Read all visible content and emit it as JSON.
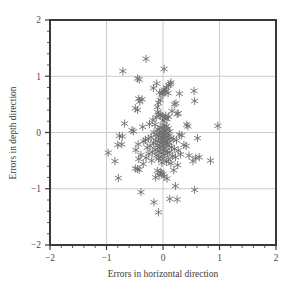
{
  "chart_data": {
    "type": "scatter",
    "title": "",
    "xlabel": "Errors in horizontal direction",
    "ylabel": "Errors in depth direction",
    "xlim": [
      -2,
      2
    ],
    "ylim": [
      -2,
      2
    ],
    "xticks": [
      -2,
      -1,
      0,
      1,
      2
    ],
    "yticks": [
      -2,
      -1,
      0,
      1,
      2
    ],
    "xtick_labels": [
      "−2",
      "−1",
      "0",
      "1",
      "2"
    ],
    "ytick_labels": [
      "−2",
      "−1",
      "0",
      "1",
      "2"
    ],
    "minor_tick_step": 0.2,
    "grid": true,
    "grid_color": "#cccccc",
    "frame_color": "#3a3a3a",
    "background_color": "#ffffff",
    "legend": null,
    "marker": "asterisk",
    "marker_color": "#6e6e6e",
    "marker_size": 5,
    "n_points": 170,
    "series": [
      {
        "name": "errors",
        "points": [
          [
            -0.3,
            1.31
          ],
          [
            -0.71,
            1.09
          ],
          [
            0.02,
            1.13
          ],
          [
            -0.45,
            0.96
          ],
          [
            -0.42,
            0.94
          ],
          [
            0.14,
            0.89
          ],
          [
            -0.11,
            0.87
          ],
          [
            0.13,
            0.86
          ],
          [
            0.1,
            0.84
          ],
          [
            0.06,
            0.8
          ],
          [
            -0.17,
            0.79
          ],
          [
            0.02,
            0.76
          ],
          [
            0.55,
            0.74
          ],
          [
            0.01,
            0.73
          ],
          [
            0.04,
            0.72
          ],
          [
            -0.06,
            0.71
          ],
          [
            0.0,
            0.7
          ],
          [
            0.09,
            0.7
          ],
          [
            0.29,
            0.69
          ],
          [
            -0.02,
            0.68
          ],
          [
            -0.43,
            0.6
          ],
          [
            -0.37,
            0.59
          ],
          [
            -0.05,
            0.58
          ],
          [
            0.56,
            0.56
          ],
          [
            -0.41,
            0.55
          ],
          [
            -0.08,
            0.53
          ],
          [
            0.23,
            0.52
          ],
          [
            0.2,
            0.5
          ],
          [
            -0.1,
            0.45
          ],
          [
            -0.49,
            0.43
          ],
          [
            -0.45,
            0.4
          ],
          [
            0.16,
            0.38
          ],
          [
            -0.09,
            0.36
          ],
          [
            0.27,
            0.34
          ],
          [
            0.25,
            0.33
          ],
          [
            -0.07,
            0.32
          ],
          [
            -0.04,
            0.31
          ],
          [
            0.05,
            0.3
          ],
          [
            -0.01,
            0.29
          ],
          [
            0.1,
            0.28
          ],
          [
            -0.12,
            0.27
          ],
          [
            0.03,
            0.25
          ],
          [
            0.07,
            0.24
          ],
          [
            -0.18,
            0.22
          ],
          [
            0.0,
            0.21
          ],
          [
            -0.68,
            0.16
          ],
          [
            -0.24,
            0.15
          ],
          [
            -0.14,
            0.14
          ],
          [
            0.97,
            0.12
          ],
          [
            0.42,
            0.14
          ],
          [
            0.44,
            0.11
          ],
          [
            -0.36,
            0.1
          ],
          [
            0.02,
            0.13
          ],
          [
            0.06,
            0.11
          ],
          [
            -0.05,
            0.09
          ],
          [
            -0.02,
            0.08
          ],
          [
            0.09,
            0.07
          ],
          [
            -0.09,
            0.06
          ],
          [
            0.01,
            0.05
          ],
          [
            -0.55,
            0.04
          ],
          [
            -0.52,
            0.02
          ],
          [
            0.04,
            0.03
          ],
          [
            -0.06,
            0.01
          ],
          [
            0.12,
            0.02
          ],
          [
            -0.16,
            0.0
          ],
          [
            0.0,
            -0.01
          ],
          [
            0.07,
            -0.02
          ],
          [
            -0.03,
            -0.03
          ],
          [
            -0.11,
            -0.04
          ],
          [
            0.03,
            -0.05
          ],
          [
            -0.77,
            -0.06
          ],
          [
            -0.72,
            -0.07
          ],
          [
            0.29,
            -0.04
          ],
          [
            0.33,
            -0.05
          ],
          [
            0.61,
            -0.1
          ],
          [
            0.1,
            -0.06
          ],
          [
            -0.08,
            -0.07
          ],
          [
            0.05,
            -0.08
          ],
          [
            -0.01,
            -0.09
          ],
          [
            0.14,
            -0.1
          ],
          [
            -0.21,
            -0.08
          ],
          [
            -0.26,
            -0.11
          ],
          [
            0.02,
            -0.11
          ],
          [
            -0.05,
            -0.12
          ],
          [
            0.08,
            -0.13
          ],
          [
            -0.13,
            -0.14
          ],
          [
            0.0,
            -0.15
          ],
          [
            0.18,
            -0.12
          ],
          [
            0.24,
            -0.14
          ],
          [
            -0.31,
            -0.13
          ],
          [
            -0.34,
            -0.16
          ],
          [
            0.04,
            -0.16
          ],
          [
            -0.07,
            -0.17
          ],
          [
            0.11,
            -0.18
          ],
          [
            -0.02,
            -0.19
          ],
          [
            0.06,
            -0.2
          ],
          [
            -0.17,
            -0.19
          ],
          [
            -0.44,
            -0.21
          ],
          [
            -0.73,
            -0.21
          ],
          [
            0.37,
            -0.22
          ],
          [
            0.41,
            -0.24
          ],
          [
            0.01,
            -0.22
          ],
          [
            -0.1,
            -0.23
          ],
          [
            0.09,
            -0.24
          ],
          [
            -0.04,
            -0.25
          ],
          [
            0.15,
            -0.26
          ],
          [
            -0.23,
            -0.24
          ],
          [
            -0.28,
            -0.27
          ],
          [
            0.03,
            -0.27
          ],
          [
            -0.06,
            -0.28
          ],
          [
            0.2,
            -0.29
          ],
          [
            -0.14,
            -0.3
          ],
          [
            0.0,
            -0.31
          ],
          [
            -0.48,
            -0.31
          ],
          [
            0.27,
            -0.32
          ],
          [
            -0.97,
            -0.36
          ],
          [
            -0.8,
            -0.22
          ],
          [
            0.05,
            -0.33
          ],
          [
            -0.09,
            -0.34
          ],
          [
            0.12,
            -0.35
          ],
          [
            -0.02,
            -0.36
          ],
          [
            -0.19,
            -0.35
          ],
          [
            0.08,
            -0.37
          ],
          [
            -0.25,
            -0.38
          ],
          [
            -0.39,
            -0.4
          ],
          [
            0.31,
            -0.39
          ],
          [
            0.46,
            -0.41
          ],
          [
            0.02,
            -0.4
          ],
          [
            -0.12,
            -0.41
          ],
          [
            0.17,
            -0.42
          ],
          [
            -0.05,
            -0.43
          ],
          [
            0.22,
            -0.44
          ],
          [
            0.58,
            -0.45
          ],
          [
            0.64,
            -0.44
          ],
          [
            -0.3,
            -0.45
          ],
          [
            -0.43,
            -0.47
          ],
          [
            0.0,
            -0.46
          ],
          [
            -0.08,
            -0.47
          ],
          [
            0.1,
            -0.48
          ],
          [
            0.84,
            -0.5
          ],
          [
            0.53,
            -0.51
          ],
          [
            -0.85,
            -0.51
          ],
          [
            -0.2,
            -0.5
          ],
          [
            0.06,
            -0.52
          ],
          [
            -0.02,
            -0.54
          ],
          [
            0.14,
            -0.55
          ],
          [
            -0.35,
            -0.56
          ],
          [
            0.26,
            -0.58
          ],
          [
            -0.49,
            -0.64
          ],
          [
            -0.45,
            -0.65
          ],
          [
            -0.42,
            -0.66
          ],
          [
            0.19,
            -0.67
          ],
          [
            -0.1,
            -0.68
          ],
          [
            -0.05,
            -0.7
          ],
          [
            -0.03,
            -0.72
          ],
          [
            0.0,
            -0.74
          ],
          [
            -0.07,
            -0.76
          ],
          [
            0.02,
            -0.78
          ],
          [
            -0.79,
            -0.81
          ],
          [
            -0.13,
            -0.8
          ],
          [
            0.07,
            -0.82
          ],
          [
            0.22,
            -0.95
          ],
          [
            0.56,
            -1.02
          ],
          [
            -0.39,
            -1.06
          ],
          [
            -0.16,
            -1.24
          ],
          [
            0.12,
            -1.18
          ],
          [
            0.25,
            -1.19
          ],
          [
            -0.08,
            -1.42
          ]
        ]
      }
    ]
  },
  "axes": {
    "x_title": "Errors in horizontal direction",
    "y_title": "Errors in depth direction"
  }
}
